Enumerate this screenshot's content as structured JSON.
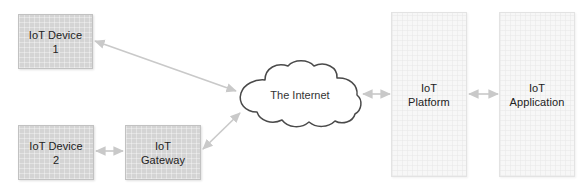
{
  "diagram": {
    "background_color": "#ffffff",
    "node_fill_solid": "#d4d4d4",
    "node_fill_light": "#f7f7f7",
    "arrow_color": "#c9c9c9",
    "cloud_stroke": "#4a4a4a",
    "nodes": [
      {
        "id": "iot-device-1",
        "line1": "IoT Device",
        "line2": "1",
        "shape": "rectangle",
        "style": "solid"
      },
      {
        "id": "iot-device-2",
        "line1": "IoT Device",
        "line2": "2",
        "shape": "rectangle",
        "style": "solid"
      },
      {
        "id": "iot-gateway",
        "line1": "IoT",
        "line2": "Gateway",
        "shape": "rectangle",
        "style": "solid"
      },
      {
        "id": "the-internet",
        "line1": "The Internet",
        "line2": "",
        "shape": "cloud",
        "style": "outline"
      },
      {
        "id": "iot-platform",
        "line1": "IoT",
        "line2": "Platform",
        "shape": "rectangle",
        "style": "light"
      },
      {
        "id": "iot-application",
        "line1": "IoT",
        "line2": "Application",
        "shape": "rectangle",
        "style": "light"
      }
    ],
    "connections": [
      {
        "id": "device1-internet",
        "from": "iot-device-1",
        "to": "the-internet",
        "direction": "bidirectional"
      },
      {
        "id": "device2-gateway",
        "from": "iot-device-2",
        "to": "iot-gateway",
        "direction": "bidirectional"
      },
      {
        "id": "gateway-internet",
        "from": "iot-gateway",
        "to": "the-internet",
        "direction": "bidirectional"
      },
      {
        "id": "internet-platform",
        "from": "the-internet",
        "to": "iot-platform",
        "direction": "bidirectional"
      },
      {
        "id": "platform-application",
        "from": "iot-platform",
        "to": "iot-application",
        "direction": "bidirectional"
      }
    ]
  }
}
